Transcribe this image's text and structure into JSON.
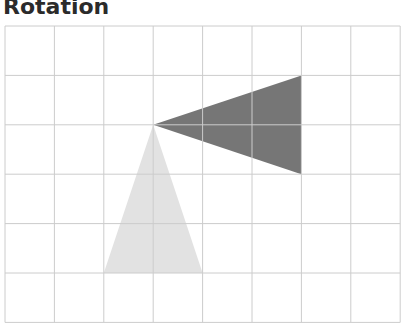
{
  "title": "Rotation",
  "diagram": {
    "grid": {
      "columns": 8,
      "rows": 6,
      "x0": 5,
      "y0": 26,
      "cell": 49.4,
      "line_color": "#cccccc"
    },
    "shapes": [
      {
        "name": "original-triangle",
        "color": "#e2e2e2",
        "points": [
          [
            3,
            2
          ],
          [
            2,
            5
          ],
          [
            4,
            5
          ]
        ]
      },
      {
        "name": "rotated-triangle",
        "color": "#767676",
        "points": [
          [
            3,
            2
          ],
          [
            6,
            1
          ],
          [
            6,
            3
          ]
        ]
      }
    ]
  }
}
